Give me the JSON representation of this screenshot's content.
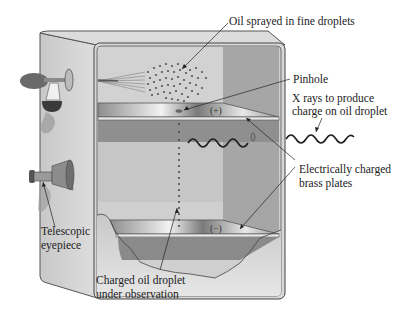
{
  "diagram": {
    "labels": {
      "oil_spray": "Oil sprayed in fine droplets",
      "pinhole": "Pinhole",
      "xrays_line1": "X rays to produce",
      "xrays_line2": "charge on oil droplet",
      "plates_line1": "Electrically charged",
      "plates_line2": "brass plates",
      "eyepiece_line1": "Telescopic",
      "eyepiece_line2": "eyepiece",
      "droplet_line1": "Charged oil droplet",
      "droplet_line2": "under observation"
    },
    "plate_signs": {
      "top": "(+)",
      "bottom": "(−)"
    },
    "components": [
      "atomizer-bulb",
      "telescopic-eyepiece",
      "upper-brass-plate",
      "lower-brass-plate",
      "x-ray-wave",
      "pinhole",
      "oil-droplets"
    ]
  }
}
